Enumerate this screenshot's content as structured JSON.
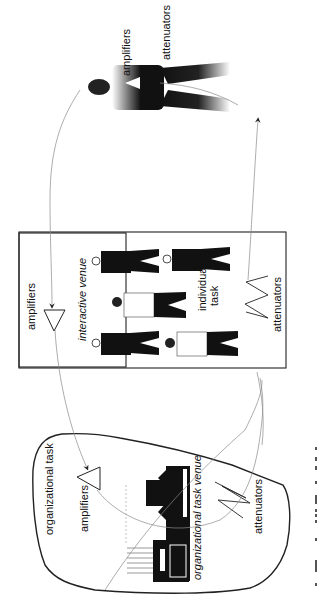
{
  "diagram": {
    "orientation": "rotated 90deg clockwise",
    "colors": {
      "ink": "#111111",
      "arrow": "#8a8a8a",
      "background": "#ffffff"
    },
    "top_figure": {
      "labels": {
        "amplifiers": "amplifiers",
        "attenuators": "attenuators"
      }
    },
    "interactive_box": {
      "title": "interactive venue",
      "amplifiers_label": "amplifiers",
      "attenuators_label": "attenuators",
      "individual_task_line1": "individual",
      "individual_task_line2": "task",
      "people": [
        {
          "position": "top-left",
          "style": "dark"
        },
        {
          "position": "top-right",
          "style": "dark"
        },
        {
          "position": "center",
          "style": "light"
        },
        {
          "position": "bottom-left",
          "style": "dark"
        },
        {
          "position": "bottom-right",
          "style": "light"
        }
      ]
    },
    "organizational_region": {
      "title": "organizational task",
      "amplifiers_label": "amplifiers",
      "venue_label": "organizational task venue",
      "attenuators_label": "attenuators"
    },
    "caption": {
      "text": "Figure 4.x: ...",
      "visible": "partially cut off"
    }
  }
}
